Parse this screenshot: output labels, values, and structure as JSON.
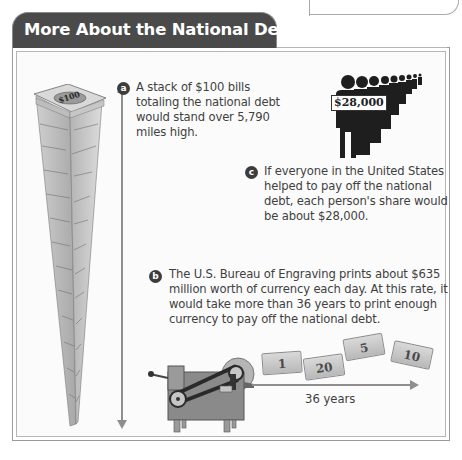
{
  "header": {
    "title": "More About the National Debt"
  },
  "facts": {
    "a": {
      "marker": "a",
      "lines": [
        "A stack of $100 bills",
        "totaling the national debt",
        "would stand over 5,790",
        "miles high."
      ]
    },
    "b": {
      "marker": "b",
      "lines": [
        "The U.S. Bureau of Engraving prints about $635",
        "million worth of currency each day. At this rate, it",
        "would take more than 36 years to print enough",
        "currency to pay off the national debt."
      ]
    },
    "c": {
      "marker": "c",
      "lines": [
        "If everyone in the United States",
        "helped to pay off the national",
        "debt, each person's share would",
        "be about $28,000."
      ]
    }
  },
  "illustrations": {
    "stack_label": "$100",
    "people_label": "$28,000",
    "bills": [
      "1",
      "20",
      "5",
      "10"
    ],
    "timeline_label": "36 years"
  },
  "colors": {
    "header_bg": "#4a4a4a",
    "marker_bg": "#3c3c3c",
    "arrow": "#8e8e8e"
  }
}
